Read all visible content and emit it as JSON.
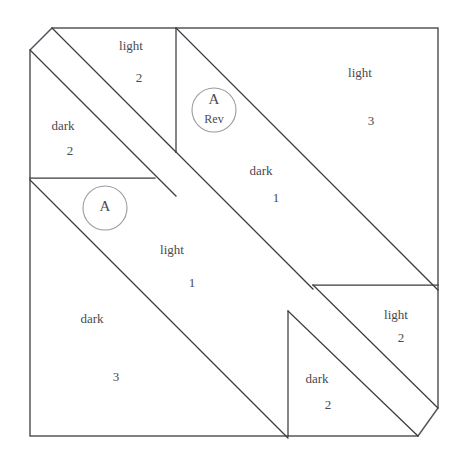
{
  "diagram": {
    "background_color": "#ffffff",
    "line_color": "#3b3b40",
    "outer_line_color": "#55555c",
    "marker_color": "#9a9aa0",
    "text_color": "#4a4a50"
  },
  "pieces": [
    {
      "id": "light-2-top",
      "fabric": "light",
      "number": "2",
      "label_x": 131,
      "label_y": 47,
      "number_x": 139,
      "number_y": 79
    },
    {
      "id": "dark-2-left",
      "fabric": "dark",
      "number": "2",
      "label_x": 63,
      "label_y": 127,
      "number_x": 70,
      "number_y": 152
    },
    {
      "id": "light-3-right",
      "fabric": "light",
      "number": "3",
      "label_x": 360,
      "label_y": 74,
      "number_x": 371,
      "number_y": 122
    },
    {
      "id": "dark-1-center",
      "fabric": "dark",
      "number": "1",
      "label_x": 261,
      "label_y": 172,
      "number_x": 276,
      "number_y": 199
    },
    {
      "id": "light-1-center",
      "fabric": "light",
      "number": "1",
      "label_x": 172,
      "label_y": 251,
      "number_x": 192,
      "number_y": 284
    },
    {
      "id": "dark-3-bottom",
      "fabric": "dark",
      "number": "3",
      "label_x": 92,
      "label_y": 320,
      "number_x": 116,
      "number_y": 378
    },
    {
      "id": "light-2-right",
      "fabric": "light",
      "number": "2",
      "label_x": 396,
      "label_y": 316,
      "number_x": 401,
      "number_y": 339
    },
    {
      "id": "dark-2-bottom",
      "fabric": "dark",
      "number": "2",
      "label_x": 317,
      "label_y": 380,
      "number_x": 328,
      "number_y": 406
    }
  ],
  "template_markers": [
    {
      "id": "template-a-rev",
      "letter": "A",
      "sub": "Rev",
      "cx": 214,
      "cy": 110,
      "r": 22,
      "letter_y": 101,
      "sub_y": 120
    },
    {
      "id": "template-a",
      "letter": "A",
      "sub": "",
      "cx": 105,
      "cy": 208,
      "r": 22,
      "letter_y": 208,
      "sub_y": 208
    }
  ],
  "geometry": {
    "outline": "M 52 28 L 438 28 L 438 408 L 418 436 L 30 436 L 30 50 Z",
    "seams": [
      "M 52 28 L 176 152",
      "M 30 50 L 176 196",
      "M 176 28 L 438 290",
      "M 176 152 L 313 289",
      "M 30 178 L 155 178",
      "M 313 285 L 438 285",
      "M 288 311 L 288 436",
      "M 176 28 L 176 152",
      "M 30 180 L 288 438",
      "M 288 311 L 418 436",
      "M 438 408 L 418 436"
    ]
  }
}
